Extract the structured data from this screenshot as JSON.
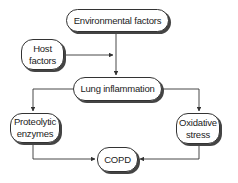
{
  "diagram": {
    "nodes": [
      {
        "id": "env",
        "label": "Environmental factors"
      },
      {
        "id": "host",
        "label": "Host factors"
      },
      {
        "id": "lung",
        "label": "Lung inflammation"
      },
      {
        "id": "prot",
        "label": "Proteolytic enzymes"
      },
      {
        "id": "oxid",
        "label": "Oxidative stress"
      },
      {
        "id": "copd",
        "label": "COPD"
      }
    ],
    "edges": [
      {
        "from": "env",
        "to": "lung"
      },
      {
        "from": "host",
        "to": "lung"
      },
      {
        "from": "lung",
        "to": "prot"
      },
      {
        "from": "lung",
        "to": "oxid"
      },
      {
        "from": "prot",
        "to": "copd"
      },
      {
        "from": "oxid",
        "to": "copd"
      }
    ],
    "colors": {
      "line": "#333333",
      "background": "#ffffff"
    }
  }
}
